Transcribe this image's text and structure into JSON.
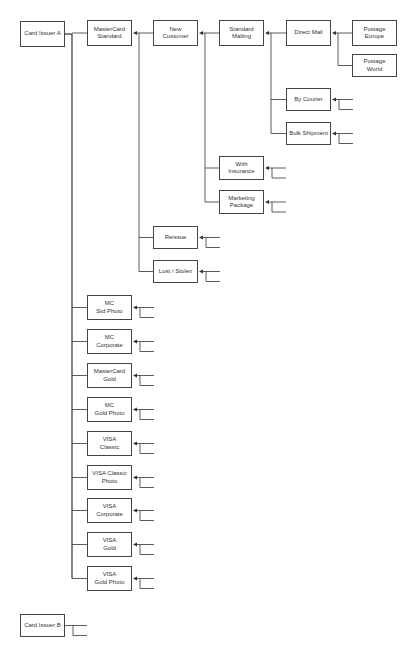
{
  "diagram": {
    "type": "hierarchy-tree",
    "direction": "left-to-right, arrows point to parent",
    "line_color": "#333333",
    "box_border_color": "#444444",
    "nodes": [
      {
        "id": "card-issuer-a",
        "label": "Card Issuer A",
        "x": 20,
        "y": 21,
        "w": 45,
        "h": 26
      },
      {
        "id": "mastercard-standard",
        "label": "MasterCard\nStandard",
        "x": 87,
        "y": 20,
        "w": 45,
        "h": 26
      },
      {
        "id": "new-customer",
        "label": "New\nCustomer",
        "x": 153,
        "y": 20,
        "w": 45,
        "h": 26
      },
      {
        "id": "standard-mailing",
        "label": "Standard\nMailing",
        "x": 219,
        "y": 20,
        "w": 45,
        "h": 26
      },
      {
        "id": "direct-mail",
        "label": "Direct Mail",
        "x": 286,
        "y": 20,
        "w": 45,
        "h": 26
      },
      {
        "id": "postage-europe",
        "label": "Postage\nEurope",
        "x": 352,
        "y": 20,
        "w": 45,
        "h": 26
      },
      {
        "id": "postage-world",
        "label": "Postage World",
        "x": 352,
        "y": 54,
        "w": 45,
        "h": 23
      },
      {
        "id": "by-courier",
        "label": "By Courier",
        "x": 286,
        "y": 88,
        "w": 45,
        "h": 23
      },
      {
        "id": "bulk-shipment",
        "label": "Bulk Shipment",
        "x": 286,
        "y": 122,
        "w": 45,
        "h": 23
      },
      {
        "id": "with-insurance",
        "label": "With\nInsurance",
        "x": 219,
        "y": 156,
        "w": 45,
        "h": 24
      },
      {
        "id": "marketing-package",
        "label": "Marketing\nPackage",
        "x": 219,
        "y": 190,
        "w": 45,
        "h": 24
      },
      {
        "id": "reissue",
        "label": "Reissue",
        "x": 153,
        "y": 226,
        "w": 45,
        "h": 23
      },
      {
        "id": "lost-stolen",
        "label": "Lost / Stolen",
        "x": 153,
        "y": 260,
        "w": 45,
        "h": 23
      },
      {
        "id": "mc-std-photo",
        "label": "MC\nStd Photo",
        "x": 87,
        "y": 295,
        "w": 45,
        "h": 25
      },
      {
        "id": "mc-corporate",
        "label": "MC\nCorporate",
        "x": 87,
        "y": 329,
        "w": 45,
        "h": 25
      },
      {
        "id": "mastercard-gold",
        "label": "MasterCard\nGold",
        "x": 87,
        "y": 363,
        "w": 45,
        "h": 25
      },
      {
        "id": "mc-gold-photo",
        "label": "MC\nGold Photo",
        "x": 87,
        "y": 397,
        "w": 45,
        "h": 25
      },
      {
        "id": "visa-classic",
        "label": "VISA\nClassic",
        "x": 87,
        "y": 431,
        "w": 45,
        "h": 25
      },
      {
        "id": "visa-classic-photo",
        "label": "VISA Classic\nPhoto",
        "x": 87,
        "y": 465,
        "w": 45,
        "h": 25
      },
      {
        "id": "visa-corporate",
        "label": "VISA\nCorporate",
        "x": 87,
        "y": 498,
        "w": 45,
        "h": 25
      },
      {
        "id": "visa-gold",
        "label": "VISA\nGold",
        "x": 87,
        "y": 532,
        "w": 45,
        "h": 25
      },
      {
        "id": "visa-gold-photo",
        "label": "VISA\nGold Photo",
        "x": 87,
        "y": 566,
        "w": 45,
        "h": 25
      },
      {
        "id": "card-issuer-b",
        "label": "Card Issuer B",
        "x": 20,
        "y": 614,
        "w": 45,
        "h": 23
      }
    ],
    "edges": [
      {
        "parent": "card-issuer-a",
        "children": [
          "mastercard-standard",
          "mc-std-photo",
          "mc-corporate",
          "mastercard-gold",
          "mc-gold-photo",
          "visa-classic",
          "visa-classic-photo",
          "visa-corporate",
          "visa-gold",
          "visa-gold-photo"
        ]
      },
      {
        "parent": "mastercard-standard",
        "children": [
          "new-customer",
          "reissue",
          "lost-stolen"
        ]
      },
      {
        "parent": "new-customer",
        "children": [
          "standard-mailing",
          "with-insurance",
          "marketing-package"
        ]
      },
      {
        "parent": "standard-mailing",
        "children": [
          "direct-mail",
          "by-courier",
          "bulk-shipment"
        ]
      },
      {
        "parent": "direct-mail",
        "children": [
          "postage-europe",
          "postage-world"
        ]
      }
    ],
    "collapsed_stubs": [
      "by-courier",
      "bulk-shipment",
      "with-insurance",
      "marketing-package",
      "reissue",
      "lost-stolen",
      "mc-std-photo",
      "mc-corporate",
      "mastercard-gold",
      "mc-gold-photo",
      "visa-classic",
      "visa-classic-photo",
      "visa-corporate",
      "visa-gold",
      "visa-gold-photo",
      "card-issuer-b"
    ]
  }
}
